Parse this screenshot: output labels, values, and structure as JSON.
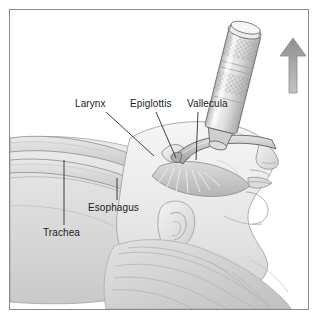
{
  "figure": {
    "view": "lateral / sagittal profile of supine patient head and neck",
    "style": "grayscale pencil-and-wash medical illustration",
    "border_color": "#8a8a8a",
    "background_color": "#ffffff"
  },
  "labels": {
    "larynx": "Larynx",
    "epiglottis": "Epiglottis",
    "vallecula": "Vallecula",
    "esophagus": "Esophagus",
    "trachea": "Trachea"
  },
  "annotations": {
    "leader_line_color": "#2b2b2b",
    "items": [
      {
        "label": "Larynx",
        "label_x": 65,
        "label_y": 89,
        "tip_x": 144,
        "tip_y": 146
      },
      {
        "label": "Epiglottis",
        "label_x": 120,
        "label_y": 89,
        "tip_x": 166,
        "tip_y": 148
      },
      {
        "label": "Vallecula",
        "label_x": 177,
        "label_y": 89,
        "tip_x": 186,
        "tip_y": 150
      },
      {
        "label": "Esophagus",
        "label_x": 78,
        "label_y": 193,
        "tip_x": 107,
        "tip_y": 168
      },
      {
        "label": "Trachea",
        "label_x": 33,
        "label_y": 218,
        "tip_x": 54,
        "tip_y": 150
      }
    ]
  },
  "instrument": {
    "name": "laryngoscope",
    "handle_texture": "knurled cross-hatch grip bands",
    "handle_color": "#dcdcdc",
    "handle_outline": "#6e6e6e",
    "blade_color": "#bdbdbd",
    "blade_outline": "#5d5d5d",
    "blade_type": "curved Macintosh blade"
  },
  "direction_arrow": {
    "name": "lift-direction-arrow",
    "direction": "up",
    "fill": "#9c9c9c",
    "outline": "#8a8a8a"
  },
  "anatomy": {
    "tones": {
      "skin_light": "#f2f2f2",
      "skin_mid": "#dedede",
      "skin_shadow": "#c3c3c3",
      "tissue_outline": "#8e8e8e",
      "deep_shadow": "#a8a8a8",
      "hair": "#d2d2d2"
    },
    "structures": [
      "head in lateral profile",
      "nose",
      "lips",
      "chin and jaw",
      "ear",
      "hair",
      "tongue displaced by blade",
      "epiglottis",
      "vallecula",
      "larynx",
      "trachea",
      "esophagus",
      "neck and upper chest"
    ]
  }
}
